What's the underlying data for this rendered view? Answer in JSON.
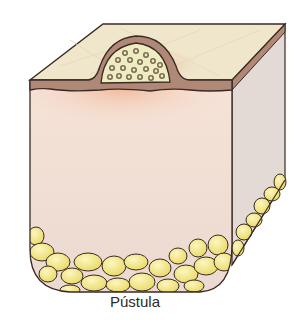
{
  "figure": {
    "caption": "Pústula"
  },
  "colors": {
    "skin_surface": "#efe6cc",
    "epidermis": "#b08878",
    "dermis": "#f3ddd2",
    "dermis_flush": "#f0b79c",
    "side_face": "#e0d8d4",
    "pus": "#efecc4",
    "pus_cells": "#9a8e6c",
    "fat": "#f1e588",
    "outline": "#3a2a22"
  }
}
